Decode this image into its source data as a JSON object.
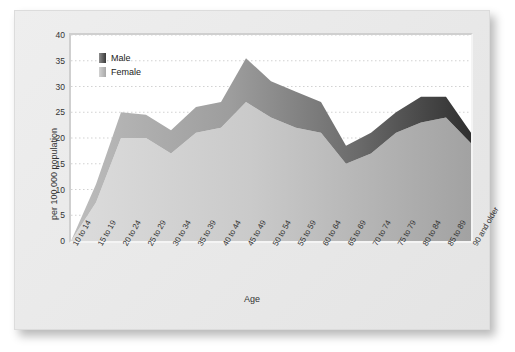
{
  "chart_data": {
    "type": "area",
    "stacked": true,
    "title": "",
    "xlabel": "Age",
    "ylabel": "per 100 000 population",
    "ylim": [
      0,
      40
    ],
    "ytick_step": 5,
    "yticks": [
      "40",
      "35",
      "30",
      "25",
      "20",
      "15",
      "10",
      "5",
      "0"
    ],
    "grid": true,
    "grid_style": "dotted-horizontal",
    "legend_position": "top-left",
    "categories": [
      "10 to 14",
      "15 to 19",
      "20 to 24",
      "25 to 29",
      "30 to 34",
      "35 to 39",
      "40 to 44",
      "45 to 49",
      "50 to 54",
      "55 to 59",
      "60 to 64",
      "65 to 69",
      "70 to 74",
      "75 to 79",
      "80 to 84",
      "85 to 89",
      "90 and older"
    ],
    "series": [
      {
        "name": "Female",
        "color": "#c9c9c9",
        "values": [
          0,
          7.5,
          20,
          20,
          17,
          21,
          22,
          27,
          24,
          22,
          21,
          15,
          17,
          21,
          23,
          24,
          19
        ]
      },
      {
        "name": "Male",
        "color": "#8f8f8f",
        "values": [
          0,
          3.5,
          5,
          4.5,
          4.5,
          5,
          5,
          8.5,
          7,
          7,
          6,
          3.5,
          4,
          4,
          5,
          4,
          2
        ]
      }
    ],
    "totals": [
      0,
      11,
      25,
      24.5,
      21.5,
      26,
      27,
      35.5,
      31,
      29,
      27,
      18.5,
      21,
      25,
      28,
      28,
      21
    ],
    "annotations": []
  },
  "legend": {
    "items": [
      {
        "label": "Male",
        "color": "#6e6e6e"
      },
      {
        "label": "Female",
        "color": "#b9b9b9"
      }
    ]
  },
  "axes": {
    "x_title": "Age",
    "y_title": "per 100 000 population"
  }
}
